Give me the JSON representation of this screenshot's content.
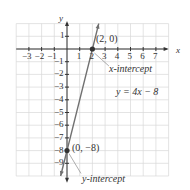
{
  "chart_data": {
    "type": "line",
    "title": "",
    "xlabel": "x",
    "ylabel": "y",
    "xlim": [
      -4,
      8
    ],
    "ylim": [
      -10,
      2
    ],
    "grid": true,
    "x_ticks": [
      -3,
      -2,
      -1,
      1,
      2,
      3,
      4,
      5,
      6,
      7
    ],
    "y_ticks": [
      1,
      -1,
      -2,
      -3,
      -4,
      -5,
      -6,
      -7,
      -8,
      -9
    ],
    "series": [
      {
        "name": "y = 4x − 8",
        "equation": "y = 4x - 8",
        "x": [
          -0.5,
          2.5
        ],
        "y": [
          -10,
          2
        ]
      }
    ],
    "points": [
      {
        "x": 2,
        "y": 0,
        "label": "(2, 0)",
        "annotation": "x-intercept"
      },
      {
        "x": 0,
        "y": -8,
        "label": "(0, −8)",
        "annotation": "y-intercept"
      }
    ],
    "annotations": [
      "x-intercept",
      "y-intercept",
      "y = 4x − 8"
    ]
  },
  "labels": {
    "x_axis": "x",
    "y_axis": "y",
    "equation": "y = 4x − 8",
    "point_x_int": "(2, 0)",
    "point_y_int": "(0, −8)",
    "x_intercept": "x-intercept",
    "y_intercept": "y-intercept"
  },
  "colors": {
    "line": "#707070",
    "axis": "#333333",
    "grid": "#d9d9d9",
    "point": "#333333"
  }
}
